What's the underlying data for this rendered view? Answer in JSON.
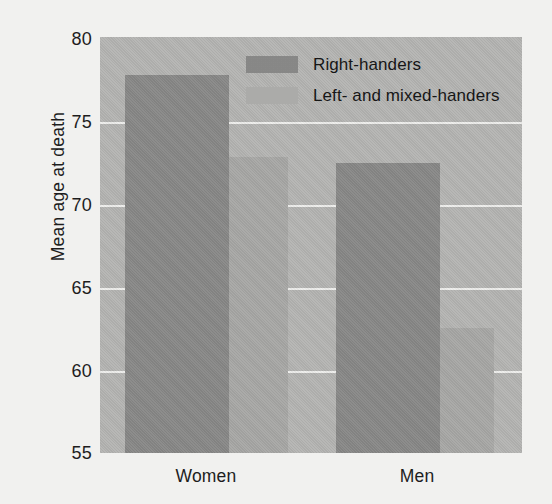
{
  "chart_data": {
    "type": "bar",
    "title": "",
    "xlabel": "",
    "ylabel": "Mean age at death",
    "categories": [
      "Women",
      "Men"
    ],
    "series": [
      {
        "name": "Right-handers",
        "values": [
          77.7,
          72.4
        ],
        "color": "#898988"
      },
      {
        "name": "Left- and mixed-handers",
        "values": [
          72.8,
          62.5
        ],
        "color": "#a9a9a7"
      }
    ],
    "ylim": [
      55,
      80
    ],
    "yticks": [
      80,
      75,
      70,
      65,
      60,
      55
    ],
    "ytick_labels": [
      "80",
      "75",
      "70",
      "65",
      "60",
      "55"
    ],
    "grid": true,
    "legend_position": "top-center",
    "plot_background": "#b6b6b4",
    "gridline_color": "#f0f0ee",
    "figure_background": "#f3f3f1"
  },
  "axis": {
    "y_title": "Mean age at death",
    "y_tick_0": "80",
    "y_tick_1": "75",
    "y_tick_2": "70",
    "y_tick_3": "65",
    "y_tick_4": "60",
    "y_tick_5": "55",
    "x_tick_0": "Women",
    "x_tick_1": "Men"
  },
  "legend": {
    "item_0": "Right-handers",
    "item_1": "Left- and mixed-handers"
  }
}
